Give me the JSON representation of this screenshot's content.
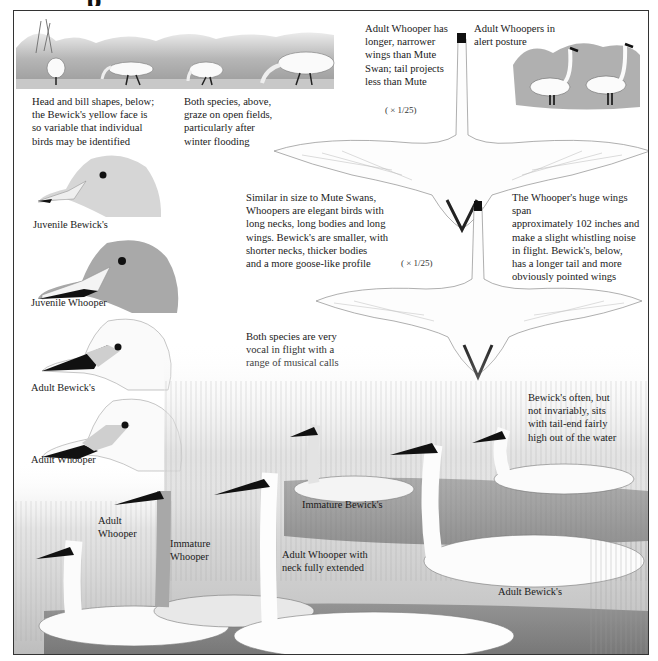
{
  "page": {
    "title_fragment": "p",
    "accent_colors": {
      "ink": "#1a1a1a",
      "frame": "#333333",
      "paper": "#ffffff",
      "pencil_gray": "#9a9a9a"
    }
  },
  "captions": {
    "head_shapes": "Head and bill shapes, below;\nthe Bewick's yellow face is\nso variable that individual\nbirds may be identified",
    "grazing": "Both species, above,\ngraze on open fields,\nparticularly after\nwinter flooding",
    "whooper_wings": "Adult Whooper has\nlonger, narrower\nwings than Mute\nSwan; tail projects\nless than Mute",
    "alert_posture": "Adult Whoopers in\nalert posture",
    "size_compare": "Similar in size to Mute Swans,\nWhoopers are elegant birds with\nlong necks, long bodies and long\nwings. Bewick's are smaller, with\nshorter necks, thicker bodies\nand a more goose-like profile",
    "wingspan": "The Whooper's huge wings span\napproximately 102 inches and\nmake a slight whistling noise\nin flight. Bewick's, below,\nhas a longer tail and more\nobviously pointed wings",
    "vocal": "Both species are very\nvocal in flight with a\nrange of musical calls",
    "tail_end": "Bewick's often, but\nnot invariably, sits\nwith tail-end fairly\nhigh out of the water"
  },
  "scale_labels": {
    "upper_flight": "( × 1/25)",
    "lower_flight": "( × 1/25)"
  },
  "head_labels": [
    "Juvenile Bewick's",
    "Juvenile Whooper",
    "Adult Bewick's",
    "Adult Whooper"
  ],
  "swimming_labels": {
    "adult_whooper_left": "Adult\nWhooper",
    "immature_whooper": "Immature\nWhooper",
    "immature_bewicks": "Immature Bewick's",
    "adult_whooper_extended": "Adult Whooper with\nneck fully extended",
    "adult_bewicks": "Adult Bewick's"
  },
  "illustrations": [
    {
      "name": "grazing-swans-scene",
      "icon": "swan-grazing-icon"
    },
    {
      "name": "alert-whoopers-scene",
      "icon": "swan-standing-icon"
    },
    {
      "name": "whooper-flight-overhead",
      "icon": "swan-flying-icon"
    },
    {
      "name": "bewicks-flight-overhead",
      "icon": "swan-flying-icon"
    },
    {
      "name": "swimming-swans-scene",
      "icon": "swan-swimming-icon"
    }
  ]
}
